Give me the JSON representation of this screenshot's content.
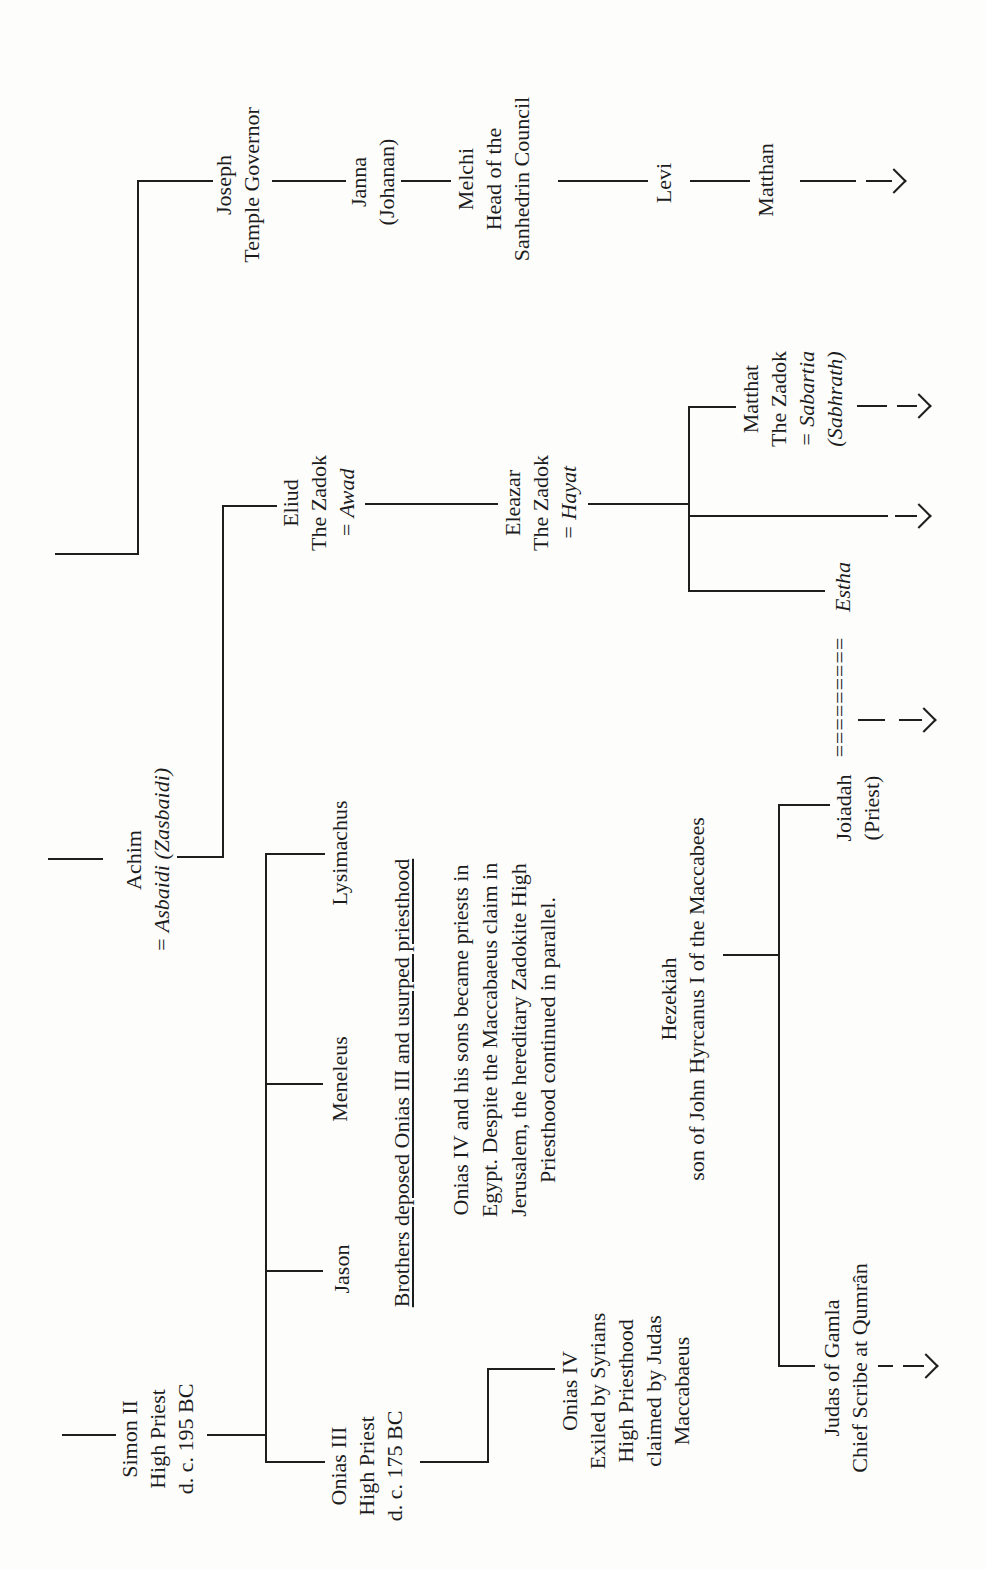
{
  "page": {
    "background": "#fdfdfc",
    "ink": "#1e1e1e",
    "description_labels": {
      "document_type": "genealogy-diagram-scan",
      "orientation": "rotated-90"
    },
    "chart": {
      "nodes": [
        {
          "id": "simon-ii",
          "cx": 130,
          "top": 116,
          "w": 190,
          "lines": [
            {
              "t": "Simon II"
            },
            {
              "t": "High Priest"
            },
            {
              "t": "d. c. 195 BC"
            }
          ]
        },
        {
          "id": "achim",
          "cx": 709,
          "top": 120,
          "w": 280,
          "lines": [
            {
              "t": "Achim"
            },
            {
              "t": "= Asbaidi (Zasbaidi)",
              "i": true
            }
          ]
        },
        {
          "id": "joseph",
          "cx": 1384,
          "top": 210,
          "w": 240,
          "lines": [
            {
              "t": "Joseph"
            },
            {
              "t": "Temple Governor"
            }
          ]
        },
        {
          "id": "eliud",
          "cx": 1066,
          "top": 277,
          "w": 180,
          "lines": [
            {
              "t": "Eliud"
            },
            {
              "t": "The Zadok"
            },
            {
              "t": "= Awad",
              "i": true
            }
          ]
        },
        {
          "id": "onias-iii",
          "cx": 103,
          "top": 325,
          "w": 190,
          "lines": [
            {
              "t": "Onias III"
            },
            {
              "t": "High Priest"
            },
            {
              "t": "d. c. 175 BC"
            }
          ]
        },
        {
          "id": "jason",
          "cx": 300,
          "top": 328,
          "w": 130,
          "lines": [
            {
              "t": "Jason"
            }
          ]
        },
        {
          "id": "meneleus",
          "cx": 490,
          "top": 326,
          "w": 170,
          "lines": [
            {
              "t": "Meneleus"
            }
          ]
        },
        {
          "id": "lysimachus",
          "cx": 716,
          "top": 326,
          "w": 200,
          "lines": [
            {
              "t": "Lysimachus"
            }
          ]
        },
        {
          "id": "janna",
          "cx": 1387,
          "top": 345,
          "w": 180,
          "lines": [
            {
              "t": "Janna"
            },
            {
              "t": "(Johanan)"
            }
          ]
        },
        {
          "id": "deposition-note",
          "cx": 486,
          "top": 388,
          "w": 580,
          "u": true,
          "lines": [
            {
              "t": "Brothers deposed Onias III and usurped priesthood"
            }
          ]
        },
        {
          "id": "onias-note",
          "cx": 529,
          "top": 446,
          "w": 480,
          "lh": 29,
          "lines": [
            {
              "t": "Onias IV and his sons became priests in"
            },
            {
              "t": "Egypt. Despite the Maccabaeus claim in"
            },
            {
              "t": "Jerusalem, the hereditary Zadokite High"
            },
            {
              "t": "Priesthood continued in parallel."
            }
          ]
        },
        {
          "id": "melchi",
          "cx": 1390,
          "top": 452,
          "w": 240,
          "lines": [
            {
              "t": "Melchi"
            },
            {
              "t": "Head of the"
            },
            {
              "t": "Sanhedrin Council"
            }
          ]
        },
        {
          "id": "eleazar",
          "cx": 1066,
          "top": 499,
          "w": 180,
          "lines": [
            {
              "t": "Eleazar"
            },
            {
              "t": "The Zadok"
            },
            {
              "t": "= Hayat",
              "i": true
            }
          ]
        },
        {
          "id": "onias-iv",
          "cx": 178,
          "top": 556,
          "w": 230,
          "lines": [
            {
              "t": "Onias IV"
            },
            {
              "t": "Exiled by Syrians"
            },
            {
              "t": "High Priesthood"
            },
            {
              "t": "claimed by Judas"
            },
            {
              "t": "Maccabaeus"
            }
          ]
        },
        {
          "id": "levi",
          "cx": 1386,
          "top": 650,
          "w": 120,
          "lines": [
            {
              "t": "Levi"
            }
          ]
        },
        {
          "id": "hezekiah",
          "cx": 570,
          "top": 655,
          "w": 460,
          "lines": [
            {
              "t": "Hezekiah"
            },
            {
              "t": "son of John Hyrcanus I of the Maccabees"
            }
          ]
        },
        {
          "id": "matthat",
          "cx": 1170,
          "top": 737,
          "w": 180,
          "lines": [
            {
              "t": "Matthat"
            },
            {
              "t": "The Zadok"
            },
            {
              "t": "= Sabartia",
              "i": true
            },
            {
              "t": "(Sabhrath)",
              "i": true
            }
          ]
        },
        {
          "id": "matthan",
          "cx": 1389,
          "top": 752,
          "w": 160,
          "lines": [
            {
              "t": "Matthan"
            }
          ]
        },
        {
          "id": "judas-of-gamla",
          "cx": 201,
          "top": 818,
          "w": 300,
          "lines": [
            {
              "t": "Judas of Gamla"
            },
            {
              "t": "Chief Scribe at Qumrân"
            }
          ]
        },
        {
          "id": "marriage-equals",
          "cx": 872,
          "top": 826,
          "w": 170,
          "ls": 1,
          "lines": [
            {
              "t": "========="
            }
          ]
        },
        {
          "id": "estha",
          "cx": 982,
          "top": 829,
          "w": 120,
          "lines": [
            {
              "t": "Estha",
              "i": true
            }
          ]
        },
        {
          "id": "joiadah",
          "cx": 761,
          "top": 830,
          "w": 150,
          "lines": [
            {
              "t": "Joiadah"
            },
            {
              "t": "(Priest)"
            }
          ]
        }
      ],
      "connectors": [
        {
          "id": "simon-ancestor-riser",
          "dir": "v",
          "x": 133,
          "y": 62,
          "len": 54
        },
        {
          "id": "achim-ancestor-riser",
          "dir": "v",
          "x": 709,
          "y": 48,
          "len": 55
        },
        {
          "id": "joseph-ancestor-riser",
          "dir": "v",
          "x": 1014,
          "y": 55,
          "len": 84
        },
        {
          "id": "joseph-jog-horizontal",
          "dir": "h",
          "x": 1014,
          "y": 137,
          "len": 375
        },
        {
          "id": "joseph-jog-drop",
          "dir": "v",
          "x": 1387,
          "y": 137,
          "len": 76
        },
        {
          "id": "joseph-janna",
          "dir": "v",
          "x": 1387,
          "y": 272,
          "len": 74
        },
        {
          "id": "janna-melchi",
          "dir": "v",
          "x": 1387,
          "y": 401,
          "len": 50
        },
        {
          "id": "melchi-levi",
          "dir": "v",
          "x": 1387,
          "y": 558,
          "len": 90
        },
        {
          "id": "levi-matthan",
          "dir": "v",
          "x": 1387,
          "y": 690,
          "len": 60
        },
        {
          "id": "matthan-tail",
          "dir": "v",
          "x": 1387,
          "y": 800,
          "len": 56
        },
        {
          "id": "simon-children-riser",
          "dir": "v",
          "x": 133,
          "y": 207,
          "len": 58
        },
        {
          "id": "simon-children-line",
          "dir": "h",
          "x": 106,
          "y": 265,
          "len": 608
        },
        {
          "id": "drop-onias-iii",
          "dir": "v",
          "x": 106,
          "y": 265,
          "len": 60
        },
        {
          "id": "drop-jason",
          "dir": "v",
          "x": 297,
          "y": 265,
          "len": 58
        },
        {
          "id": "drop-meneleus",
          "dir": "v",
          "x": 484,
          "y": 265,
          "len": 58
        },
        {
          "id": "drop-lysimachus",
          "dir": "v",
          "x": 714,
          "y": 265,
          "len": 60
        },
        {
          "id": "onias-iii-stem",
          "dir": "v",
          "x": 106,
          "y": 420,
          "len": 67
        },
        {
          "id": "onias-iv-jog",
          "dir": "h",
          "x": 106,
          "y": 487,
          "len": 95
        },
        {
          "id": "onias-iv-drop",
          "dir": "v",
          "x": 199,
          "y": 487,
          "len": 68
        },
        {
          "id": "achim-stem",
          "dir": "v",
          "x": 711,
          "y": 177,
          "len": 45
        },
        {
          "id": "achim-eliud-jog",
          "dir": "h",
          "x": 711,
          "y": 222,
          "len": 353
        },
        {
          "id": "eliud-drop",
          "dir": "v",
          "x": 1062,
          "y": 222,
          "len": 55
        },
        {
          "id": "eliud-eleazar",
          "dir": "v",
          "x": 1064,
          "y": 365,
          "len": 133
        },
        {
          "id": "eleazar-stem",
          "dir": "v",
          "x": 1064,
          "y": 588,
          "len": 100
        },
        {
          "id": "eleazar-children-line",
          "dir": "h",
          "x": 977,
          "y": 688,
          "len": 186
        },
        {
          "id": "drop-estha",
          "dir": "v",
          "x": 977,
          "y": 688,
          "len": 137
        },
        {
          "id": "middle-descent-shaft",
          "dir": "v",
          "x": 1052,
          "y": 688,
          "len": 200
        },
        {
          "id": "drop-matthat",
          "dir": "v",
          "x": 1161,
          "y": 688,
          "len": 48
        },
        {
          "id": "hezekiah-stem",
          "dir": "v",
          "x": 613,
          "y": 723,
          "len": 55
        },
        {
          "id": "hezekiah-children-line",
          "dir": "h",
          "x": 202,
          "y": 778,
          "len": 561
        },
        {
          "id": "drop-joiadah",
          "dir": "v",
          "x": 763,
          "y": 778,
          "len": 52
        },
        {
          "id": "drop-judas",
          "dir": "v",
          "x": 202,
          "y": 778,
          "len": 37
        },
        {
          "id": "matthat-dash",
          "dir": "v",
          "x": 1162,
          "y": 857,
          "len": 30
        },
        {
          "id": "estha-union-dash",
          "dir": "v",
          "x": 848,
          "y": 858,
          "len": 27
        },
        {
          "id": "judas-dash",
          "dir": "v",
          "x": 202,
          "y": 878,
          "len": 15
        }
      ],
      "arrows": [
        {
          "id": "matthan-continues",
          "x": 1387,
          "shaftY": 866,
          "shaftLen": 26,
          "tipY": 904
        },
        {
          "id": "matthat-continues",
          "x": 1162,
          "shaftY": 897,
          "shaftLen": 20,
          "tipY": 929
        },
        {
          "id": "eleazar-continues",
          "x": 1052,
          "shaftY": 895,
          "shaftLen": 22,
          "tipY": 929
        },
        {
          "id": "joiadah-estha-line-continues",
          "x": 848,
          "shaftY": 899,
          "shaftLen": 23,
          "tipY": 934
        },
        {
          "id": "judas-continues",
          "x": 202,
          "shaftY": 903,
          "shaftLen": 21,
          "tipY": 936
        }
      ]
    }
  }
}
